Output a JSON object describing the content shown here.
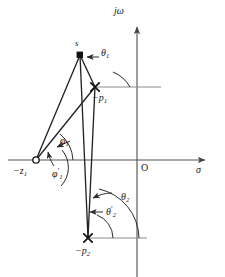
{
  "figure": {
    "background_color": "#ffffff",
    "stroke_color": "#2b2b2b",
    "axis_color": "#555555"
  },
  "axes": {
    "imaginary_label": "jω",
    "real_label": "σ",
    "origin_label": "O"
  },
  "points": [
    {
      "id": "s",
      "label": "s",
      "marker": "filled-square",
      "x": 80,
      "y": 55
    },
    {
      "id": "p1",
      "label": "−p",
      "sub": "1",
      "marker": "cross",
      "x": 95,
      "y": 87
    },
    {
      "id": "p2",
      "label": "−p",
      "sub": "2",
      "marker": "cross",
      "x": 88,
      "y": 238
    },
    {
      "id": "z1",
      "label": "−z",
      "sub": "1",
      "marker": "open-circle",
      "x": 36,
      "y": 160
    }
  ],
  "angles": [
    {
      "id": "theta1",
      "label": "θ",
      "sub": "1",
      "prime": "",
      "x": 101,
      "y": 52
    },
    {
      "id": "theta2",
      "label": "θ",
      "sub": "2",
      "prime": "",
      "x": 121,
      "y": 196
    },
    {
      "id": "theta2_prime",
      "label": "θ",
      "sub": "2",
      "prime": "′",
      "x": 106,
      "y": 211
    },
    {
      "id": "phi1",
      "label": "φ",
      "sub": "1",
      "prime": "",
      "x": 60,
      "y": 140
    },
    {
      "id": "phi1_prime",
      "label": "φ",
      "sub": "1",
      "prime": "′",
      "x": 52,
      "y": 173
    }
  ],
  "point_labels": {
    "s": "s",
    "p1_minus": "−p",
    "p1_sub": "1",
    "p2_minus": "−p",
    "p2_sub": "2",
    "z1_minus": "−z",
    "z1_sub": "1"
  }
}
